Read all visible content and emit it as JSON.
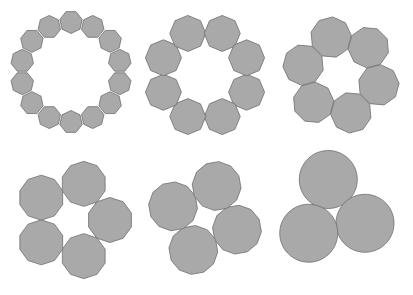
{
  "figure": {
    "fill_color": "#a9a9a9",
    "stroke_color": "#6e6e6e",
    "rings": [
      {
        "name": "heptagon-ring",
        "count": 14,
        "sides": 7,
        "cx": 71,
        "cy": 72,
        "ring_radius": 50,
        "poly_radius": 11.5,
        "rotation": 90
      },
      {
        "name": "octagon-ring",
        "count": 8,
        "sides": 8,
        "cx": 205,
        "cy": 75,
        "ring_radius": 45,
        "poly_radius": 18,
        "rotation": 22.5
      },
      {
        "name": "nonagon-ring",
        "count": 6,
        "sides": 9,
        "cx": 341,
        "cy": 75,
        "ring_radius": 39,
        "poly_radius": 20.5,
        "rotation": 15
      },
      {
        "name": "decagon-ring",
        "count": 5,
        "sides": 10,
        "cx": 72,
        "cy": 220,
        "ring_radius": 38,
        "poly_radius": 22.5,
        "rotation": 0
      },
      {
        "name": "dodecagon-ring",
        "count": 4,
        "sides": 12,
        "cx": 205,
        "cy": 218,
        "ring_radius": 34,
        "poly_radius": 24.5,
        "rotation": 20
      },
      {
        "name": "circle-ring",
        "count": 3,
        "sides": 60,
        "cx": 334,
        "cy": 212,
        "ring_radius": 33,
        "poly_radius": 29,
        "rotation": -100
      }
    ]
  }
}
